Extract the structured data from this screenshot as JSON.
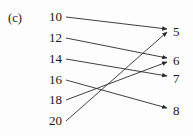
{
  "figure": {
    "part_label": "(c)",
    "domain_items": [
      {
        "label": "10",
        "y": 17
      },
      {
        "label": "12",
        "y": 38
      },
      {
        "label": "14",
        "y": 59
      },
      {
        "label": "16",
        "y": 80
      },
      {
        "label": "18",
        "y": 100
      },
      {
        "label": "20",
        "y": 121
      }
    ],
    "codomain_items": [
      {
        "label": "5",
        "y": 32
      },
      {
        "label": "6",
        "y": 61
      },
      {
        "label": "7",
        "y": 79
      },
      {
        "label": "8",
        "y": 111
      }
    ],
    "arrows": [
      {
        "from": "10",
        "to": "5",
        "x1": 66,
        "y1": 17,
        "x2": 167,
        "y2": 29
      },
      {
        "from": "12",
        "to": "6",
        "x1": 66,
        "y1": 38,
        "x2": 167,
        "y2": 58
      },
      {
        "from": "14",
        "to": "7",
        "x1": 66,
        "y1": 59,
        "x2": 167,
        "y2": 76
      },
      {
        "from": "16",
        "to": "8",
        "x1": 66,
        "y1": 80,
        "x2": 167,
        "y2": 108
      },
      {
        "from": "18",
        "to": "6",
        "x1": 66,
        "y1": 100,
        "x2": 167,
        "y2": 62
      },
      {
        "from": "20",
        "to": "5",
        "x1": 66,
        "y1": 121,
        "x2": 167,
        "y2": 32
      }
    ],
    "arrow_color": "#2a2a2e",
    "background_color": "#fdfdfd"
  }
}
